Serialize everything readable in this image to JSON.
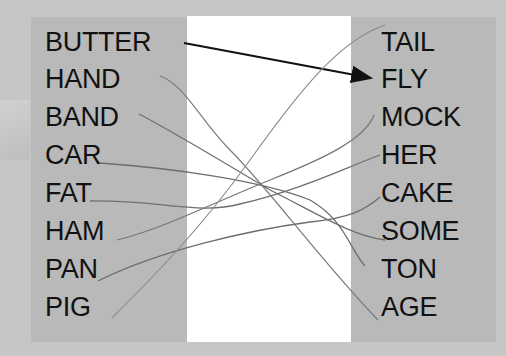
{
  "left_column": {
    "words": [
      "BUTTER",
      "HAND",
      "BAND",
      "CAR",
      "FAT",
      "HAM",
      "PAN",
      "PIG"
    ]
  },
  "right_column": {
    "words": [
      "TAIL",
      "FLY",
      "MOCK",
      "HER",
      "CAKE",
      "SOME",
      "TON",
      "AGE"
    ]
  },
  "example": {
    "from": "BUTTER",
    "to": "FLY",
    "style": "arrow"
  },
  "connections": [
    {
      "from": "HAND",
      "to": "AGE"
    },
    {
      "from": "BAND",
      "to": "SOME"
    },
    {
      "from": "CAR",
      "to": "TON"
    },
    {
      "from": "FAT",
      "to": "HER"
    },
    {
      "from": "HAM",
      "to": "MOCK"
    },
    {
      "from": "PAN",
      "to": "CAKE"
    },
    {
      "from": "PIG",
      "to": "TAIL"
    }
  ],
  "colors": {
    "background": "#c6c6c6",
    "panel": "#b9b9b9",
    "center": "#ffffff",
    "text": "#111111",
    "arrow": "#111111",
    "line": "#777777"
  }
}
